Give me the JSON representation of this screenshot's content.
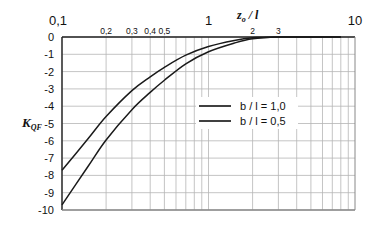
{
  "chart_data": {
    "type": "line",
    "title": "",
    "xlabel": "z_o / l",
    "ylabel": "K_QF",
    "x_scale": "log",
    "xlim": [
      0.1,
      10
    ],
    "ylim": [
      -10,
      0
    ],
    "grid": true,
    "x_major_tick_labels": [
      "0,1",
      "1",
      "10"
    ],
    "x_minor_tick_labels": [
      "0,2",
      "0,3",
      "0,4",
      "0,5",
      "2",
      "3"
    ],
    "y_tick_labels": [
      "0",
      "-1",
      "-2",
      "-3",
      "-4",
      "-5",
      "-6",
      "-7",
      "-8",
      "-9",
      "-10"
    ],
    "legend_position": "inside-right-middle",
    "series": [
      {
        "name": "b / l = 1,0",
        "x": [
          0.1,
          0.15,
          0.2,
          0.3,
          0.4,
          0.5,
          0.7,
          1.0,
          1.5,
          2.0,
          3.0,
          5.0,
          8.0
        ],
        "y": [
          -7.7,
          -5.9,
          -4.6,
          -3.1,
          -2.3,
          -1.75,
          -1.05,
          -0.55,
          -0.2,
          -0.05,
          0.0,
          0.0,
          0.0
        ]
      },
      {
        "name": "b / l = 0,5",
        "x": [
          0.1,
          0.15,
          0.2,
          0.3,
          0.4,
          0.5,
          0.7,
          1.0,
          1.5,
          2.0,
          3.0,
          5.0,
          8.0
        ],
        "y": [
          -9.7,
          -7.5,
          -5.95,
          -4.2,
          -3.2,
          -2.5,
          -1.55,
          -0.85,
          -0.35,
          -0.1,
          0.0,
          0.0,
          0.0
        ]
      }
    ]
  },
  "axis": {
    "x_title_main": "z",
    "x_title_sub": "o",
    "x_title_rest": " / l",
    "y_title_main": "K",
    "y_title_sub": "QF"
  },
  "legend": {
    "items": [
      {
        "label": "b / l = 1,0"
      },
      {
        "label": "b / l = 0,5"
      }
    ]
  }
}
